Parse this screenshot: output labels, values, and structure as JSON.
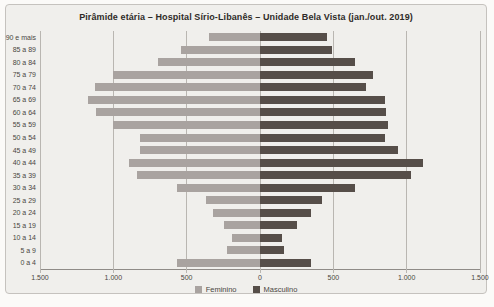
{
  "page": {
    "title": "Pirâmide etária – Hospital Sírio-Libanês – Unidade Bela Vista (jan./out. 2019)"
  },
  "colors": {
    "feminino": "#a9a3a0",
    "masculino": "#564e49",
    "gridline": "#b9b6b1",
    "axis_line": "#8f8b87",
    "card_background": "#f0efec",
    "text": "#4a4642"
  },
  "legend": {
    "items": [
      {
        "label": "Feminino",
        "color": "#a9a3a0"
      },
      {
        "label": "Masculino",
        "color": "#564e49"
      }
    ]
  },
  "chart_data": {
    "type": "bar",
    "subtype": "population-pyramid",
    "orientation": "horizontal",
    "title": "Pirâmide etária – Hospital Sírio-Libanês – Unidade Bela Vista (jan./out. 2019)",
    "categories": [
      "90 e mais",
      "85 a 89",
      "80 a 84",
      "75 a 79",
      "70 a 74",
      "65 a 69",
      "60 a 64",
      "55 a 59",
      "50 a 54",
      "45 a 49",
      "40 a 44",
      "35 a 39",
      "30 a 34",
      "25 a 29",
      "20 a 24",
      "15 a 19",
      "10 a 14",
      "5 a 9",
      "0 a 4"
    ],
    "series": [
      {
        "name": "Feminino",
        "side": "left",
        "color": "#a9a3a0",
        "values": [
          350,
          540,
          695,
          1005,
          1125,
          1170,
          1115,
          1005,
          815,
          815,
          890,
          840,
          565,
          370,
          320,
          245,
          190,
          225,
          565
        ]
      },
      {
        "name": "Masculino",
        "side": "right",
        "color": "#564e49",
        "values": [
          455,
          490,
          650,
          770,
          725,
          850,
          860,
          875,
          850,
          940,
          1110,
          1030,
          645,
          420,
          345,
          255,
          150,
          165,
          350
        ]
      }
    ],
    "x_axis": {
      "max_each_side": 1500,
      "tick_values": [
        1500,
        1000,
        500,
        0,
        500,
        1000,
        1500
      ],
      "tick_labels": [
        "1.500",
        "1.000",
        "500",
        "0",
        "500",
        "1.000",
        "1.500"
      ],
      "grid": true
    },
    "legend_position": "bottom"
  }
}
